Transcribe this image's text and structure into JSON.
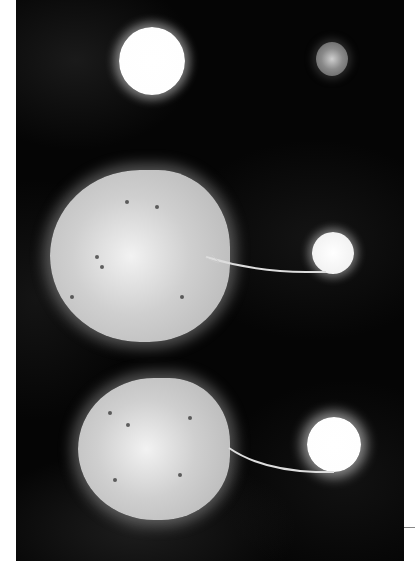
{
  "image": {
    "description": "Artist illustration of binary star evolution: a detached pair of stars at top, and two semi-detached binaries below where a distorted giant star transfers mass via a stream to a compact companion.",
    "panels": [
      {
        "name": "detached-binary",
        "primary": "bright white star",
        "secondary": "dim gray star"
      },
      {
        "name": "mass-transfer-small-companion",
        "primary": "teardrop-shaped giant with sunspots",
        "secondary": "small white star with spots"
      },
      {
        "name": "mass-transfer-bright-companion",
        "primary": "teardrop-shaped giant with sunspots",
        "secondary": "bright white star"
      }
    ],
    "colors": {
      "background": "#050505",
      "star_bright": "#ffffff",
      "star_dim": "#8a8a8a",
      "giant_surface": "#c8c8c8",
      "page": "#ffffff"
    }
  }
}
